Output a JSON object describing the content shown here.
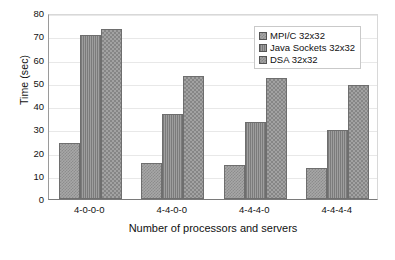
{
  "chart_data": {
    "type": "bar",
    "title": "",
    "subtitle": "",
    "xlabel": "Number of processors and servers",
    "ylabel": "Time (sec)",
    "categories": [
      "4-0-0-0",
      "4-4-0-0",
      "4-4-4-0",
      "4-4-4-4"
    ],
    "series": [
      {
        "name": "MPI/C 32x32",
        "values": [
          24.0,
          15.3,
          14.5,
          13.3
        ]
      },
      {
        "name": "Java Sockets 32x32",
        "values": [
          70.5,
          36.7,
          33.0,
          29.7
        ]
      },
      {
        "name": "DSA 32x32",
        "values": [
          73.0,
          53.0,
          52.0,
          49.0
        ]
      }
    ],
    "ylim": [
      0,
      80
    ],
    "yticks": [
      0,
      10,
      20,
      30,
      40,
      50,
      60,
      70,
      80
    ],
    "ytick_labels": [
      "0",
      "10",
      "20",
      "30",
      "40",
      "50",
      "60",
      "70",
      "80"
    ],
    "grid": true,
    "grid_axis": "y",
    "legend_position": "top-right",
    "legend_entries": [
      "MPI/C 32x32",
      "Java Sockets 32x32",
      "DSA 32x32"
    ],
    "bar_fill_patterns": [
      "dither-checker-fine",
      "vertical-lines",
      "dither-checker-coarse"
    ],
    "colors": {
      "series_0": "#a7a7a7",
      "series_1": "#8d8d8d",
      "series_2": "#a2a2a2",
      "bar_border": "#6e6e6e",
      "gridline": "#e8e8e8",
      "axis": "#7a7a7a",
      "text": "#111111",
      "background": "#ffffff"
    }
  }
}
